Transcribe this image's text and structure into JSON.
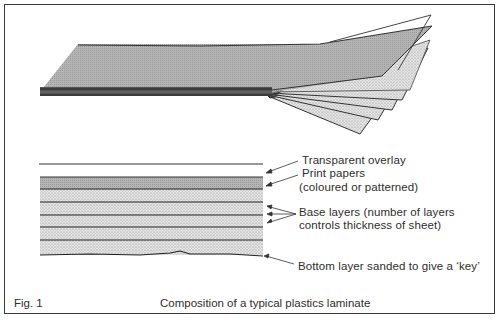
{
  "figure": {
    "number_label": "Fig. 1",
    "caption": "Composition of a typical plastics laminate"
  },
  "cross_section": {
    "labels": {
      "transparent_overlay": "Transparent overlay",
      "print_papers": "Print papers",
      "print_papers_note": "(coloured or patterned)",
      "base_layers_line1": "Base layers (number of layers",
      "base_layers_line2": "controls thickness of sheet)",
      "bottom_layer": "Bottom layer sanded to give a ‘key’"
    },
    "layers": [
      {
        "name": "transparent-overlay",
        "fill": "none"
      },
      {
        "name": "print-paper",
        "fill": "#a9a9a9"
      },
      {
        "name": "base-layer-1",
        "fill": "#d6d6d6"
      },
      {
        "name": "base-layer-2",
        "fill": "#d6d6d6"
      },
      {
        "name": "base-layer-3",
        "fill": "#d6d6d6"
      },
      {
        "name": "base-layer-4",
        "fill": "#d6d6d6"
      },
      {
        "name": "base-layer-5-sanded",
        "fill": "#d6d6d6"
      }
    ]
  },
  "colors": {
    "ink": "#2e2e2e",
    "print_paper_fill": "#a9a9a9",
    "base_fill": "#d6d6d6",
    "background": "#ffffff"
  }
}
